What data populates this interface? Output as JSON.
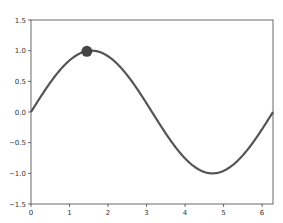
{
  "chart_data": {
    "type": "line",
    "title": "",
    "xlabel": "",
    "ylabel": "",
    "xlim": [
      0,
      6.283
    ],
    "ylim": [
      -1.5,
      1.5
    ],
    "grid": false,
    "xticks": [
      0,
      1,
      2,
      3,
      4,
      5,
      6
    ],
    "xtick_labels": [
      "0",
      "1",
      "2",
      "3",
      "4",
      "5",
      "6"
    ],
    "yticks": [
      -1.5,
      -1.0,
      -0.5,
      0.0,
      0.5,
      1.0,
      1.5
    ],
    "ytick_labels": [
      "−1.5",
      "−1.0",
      "−0.5",
      "0.0",
      "0.5",
      "1.0",
      "1.5"
    ],
    "series": [
      {
        "name": "sin(x)",
        "function": "sin",
        "x_range": [
          0,
          6.283
        ],
        "color": "#555555"
      }
    ],
    "marker": {
      "x": 1.45,
      "y": 0.99,
      "color": "#444444"
    }
  }
}
